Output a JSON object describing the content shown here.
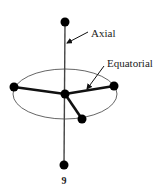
{
  "figure": {
    "labels": {
      "axial": "Axial",
      "equatorial": "Equatorial"
    },
    "caption": "9",
    "colors": {
      "atom": "#000000",
      "bond": "#111111",
      "ellipse": "#666666",
      "text": "#222222"
    }
  }
}
